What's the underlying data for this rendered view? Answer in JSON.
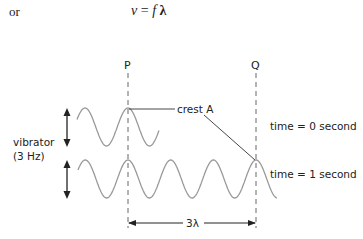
{
  "header": {
    "prefix": "or",
    "equation_v": "v",
    "equation_eq": " = ",
    "equation_f": "f",
    "equation_lambda": " λ"
  },
  "diagram": {
    "point_p": "P",
    "point_q": "Q",
    "crest_label": "crest A",
    "vibrator_label": "vibrator",
    "vibrator_freq": "(3 Hz)",
    "time0_label": "time = 0 second",
    "time1_label": "time = 1 second",
    "distance_label": "3λ",
    "wave_color": "#999999",
    "line_color": "#333333"
  }
}
